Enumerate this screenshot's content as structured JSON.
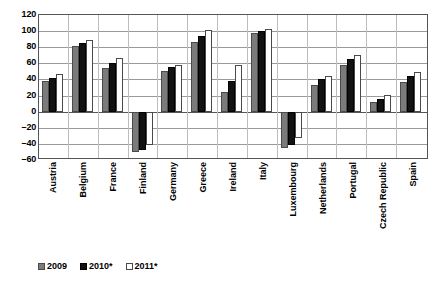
{
  "chart_data": {
    "type": "bar",
    "title": "",
    "xlabel": "",
    "ylabel": "",
    "ylim": [
      -60,
      120
    ],
    "ytick_step": 20,
    "yticks": [
      120,
      100,
      80,
      60,
      40,
      20,
      0,
      -20,
      -40,
      -60
    ],
    "ytick_labels": [
      "120",
      "100",
      "80",
      "60",
      "40",
      "20",
      "0",
      "–20",
      "–40",
      "–60"
    ],
    "grid": true,
    "legend_position": "bottom-left",
    "categories": [
      "Austria",
      "Belgium",
      "France",
      "Finland",
      "Germany",
      "Greece",
      "Ireland",
      "Italy",
      "Luxembourg",
      "Netherlands",
      "Portugal",
      "Czech Republic",
      "Spain"
    ],
    "series": [
      {
        "name": "2009",
        "color": "#7b7b7b",
        "values": [
          38,
          82,
          54,
          -50,
          50,
          86,
          25,
          98,
          -45,
          33,
          58,
          12,
          37
        ]
      },
      {
        "name": "2010*",
        "color": "#121212",
        "values": [
          42,
          85,
          60,
          -47,
          55,
          94,
          38,
          100,
          -42,
          40,
          65,
          16,
          44
        ]
      },
      {
        "name": "2011*",
        "color": "#ffffff",
        "values": [
          47,
          89,
          67,
          -42,
          58,
          101,
          58,
          103,
          -33,
          44,
          70,
          21,
          49
        ]
      }
    ]
  },
  "legend": {
    "items": [
      {
        "label": "2009",
        "key": "s2009"
      },
      {
        "label": "2010*",
        "key": "s2010"
      },
      {
        "label": "2011*",
        "key": "s2011"
      }
    ]
  }
}
